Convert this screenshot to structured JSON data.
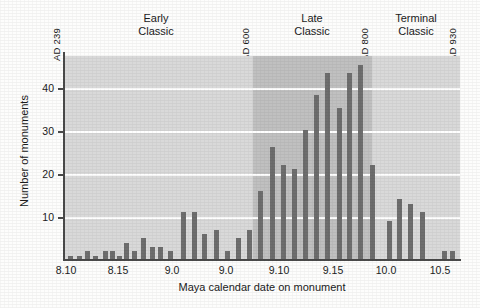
{
  "figure": {
    "background_color": "#fdfdfc",
    "plot_fill_light": "#d9d9d9",
    "plot_fill_dark": "#c0c0c0",
    "bar_color": "#6e6e6e",
    "axis_color": "#4a4a4a",
    "gridline_color": "#ffffff"
  },
  "axis": {
    "y_label": "Number of monuments",
    "x_label": "Maya calendar date on monument",
    "y_ticks": [
      {
        "label": "10",
        "value": 10
      },
      {
        "label": "20",
        "value": 20
      },
      {
        "label": "30",
        "value": 30
      },
      {
        "label": "40",
        "value": 40
      }
    ],
    "x_ticks": [
      {
        "label": "8.10",
        "value": 8.1
      },
      {
        "label": "8.15",
        "value": 8.15
      },
      {
        "label": "9.0",
        "value": 9.0
      },
      {
        "label": "9.0",
        "value": 9.05
      },
      {
        "label": "9.10",
        "value": 9.1
      },
      {
        "label": "9.15",
        "value": 9.15
      },
      {
        "label": "10.0",
        "value": 10.0
      },
      {
        "label": "10.5",
        "value": 10.05
      }
    ]
  },
  "annotations": {
    "date_markers": [
      {
        "prefix": "AD",
        "year": "239",
        "text": "AD 239",
        "value": 8.1
      },
      {
        "prefix": "AD",
        "year": "600",
        "text": "AD 600",
        "value": 9.08
      },
      {
        "prefix": "AD",
        "year": "800",
        "text": "AD 800",
        "value": 9.18
      },
      {
        "prefix": "AD",
        "year": "930",
        "text": "AD 930",
        "value": 10.06
      }
    ],
    "periods": [
      {
        "line1": "Early",
        "line2": "Classic",
        "name": "Early Classic"
      },
      {
        "line1": "Late",
        "line2": "Classic",
        "name": "Late Classic"
      },
      {
        "line1": "Terminal",
        "line2": "Classic",
        "name": "Terminal Classic"
      }
    ]
  },
  "chart_data": {
    "type": "bar",
    "title": "",
    "xlabel": "Maya calendar date on monument",
    "ylabel": "Number of monuments",
    "xlim": [
      8.095,
      10.075
    ],
    "ylim": [
      0,
      47
    ],
    "grid": true,
    "gridlines_y": [
      10,
      20,
      30,
      40
    ],
    "legend": "none",
    "shaded_regions": [
      {
        "name": "Early Classic",
        "from": 8.095,
        "to": 9.085,
        "shade": "light"
      },
      {
        "name": "Late Classic",
        "from": 9.085,
        "to": 9.185,
        "shade": "dark"
      },
      {
        "name": "Terminal Classic",
        "from": 9.185,
        "to": 10.075,
        "shade": "light"
      }
    ],
    "categories": [
      "8.10",
      "8.11",
      "8.12",
      "8.13",
      "8.14",
      "8.15",
      "8.16",
      "8.17",
      "8.18",
      "8.19",
      "9.00",
      "9.01",
      "9.02",
      "9.03",
      "9.04",
      "9.05",
      "9.06",
      "9.07",
      "9.08",
      "9.09",
      "9.10",
      "9.11",
      "9.12",
      "9.13",
      "9.14",
      "9.15",
      "9.16",
      "9.17",
      "9.18",
      "9.19",
      "10.00",
      "10.01",
      "10.02",
      "10.03",
      "10.04",
      "10.05"
    ],
    "values": [
      0,
      1,
      2,
      1,
      2,
      2,
      1,
      4,
      2,
      5,
      3,
      3,
      2,
      11,
      11,
      6,
      7,
      2,
      5,
      7,
      16,
      26,
      22,
      21,
      30,
      38,
      43,
      35,
      43,
      45,
      22,
      9,
      14,
      13,
      11,
      2
    ],
    "peak": {
      "category": "9.19",
      "value": 45
    }
  },
  "bars": [
    {
      "x": 8.105,
      "v": 1
    },
    {
      "x": 8.115,
      "v": 1
    },
    {
      "x": 8.125,
      "v": 2
    },
    {
      "x": 8.135,
      "v": 1
    },
    {
      "x": 8.147,
      "v": 2
    },
    {
      "x": 8.155,
      "v": 2
    },
    {
      "x": 8.163,
      "v": 1
    },
    {
      "x": 8.172,
      "v": 4
    },
    {
      "x": 8.182,
      "v": 2
    },
    {
      "x": 8.192,
      "v": 5
    },
    {
      "x": 8.203,
      "v": 3
    },
    {
      "x": 8.213,
      "v": 3
    },
    {
      "x": 8.225,
      "v": 2
    },
    {
      "x": 8.24,
      "v": 11
    },
    {
      "x": 8.253,
      "v": 11
    },
    {
      "x": 8.266,
      "v": 6
    },
    {
      "x": 8.28,
      "v": 7
    },
    {
      "x": 8.293,
      "v": 2
    },
    {
      "x": 8.306,
      "v": 5
    },
    {
      "x": 8.32,
      "v": 7
    },
    {
      "x": 8.333,
      "v": 16
    },
    {
      "x": 8.347,
      "v": 26
    },
    {
      "x": 8.36,
      "v": 22
    },
    {
      "x": 8.373,
      "v": 21
    },
    {
      "x": 8.387,
      "v": 30
    },
    {
      "x": 8.4,
      "v": 38
    },
    {
      "x": 8.413,
      "v": 43
    },
    {
      "x": 8.427,
      "v": 35
    },
    {
      "x": 8.44,
      "v": 43
    },
    {
      "x": 8.453,
      "v": 45
    },
    {
      "x": 8.467,
      "v": 22
    },
    {
      "x": 8.487,
      "v": 9
    },
    {
      "x": 8.5,
      "v": 14
    },
    {
      "x": 8.513,
      "v": 13
    },
    {
      "x": 8.527,
      "v": 11
    },
    {
      "x": 8.553,
      "v": 2
    },
    {
      "x": 8.563,
      "v": 2
    }
  ]
}
